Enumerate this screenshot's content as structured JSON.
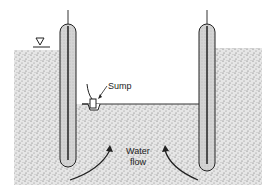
{
  "diagram": {
    "type": "dewatering excavation cross-section",
    "labels": {
      "sump": "Sump",
      "water_flow_line1": "Water",
      "water_flow_line2": "flow"
    },
    "symbols": {
      "water_table": "water-table-triangle-icon"
    },
    "colors": {
      "soil": "#bdbdbd",
      "wall_fill": "#d8d8d8",
      "line": "#222222"
    }
  }
}
